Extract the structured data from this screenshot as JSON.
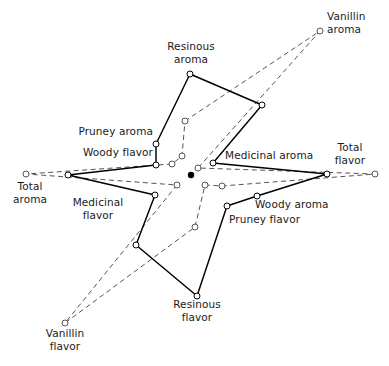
{
  "chart_data": {
    "type": "line",
    "chart_subtype": "radar",
    "title": "",
    "subtitle": "",
    "xlabel": "",
    "ylabel": "",
    "grid": false,
    "legend_position": "none",
    "axis_count": 12,
    "center": {
      "x": 191,
      "y": 175
    },
    "radial_range": [
      0,
      10
    ],
    "categories": [
      "Resinous aroma",
      "Vanillin aroma",
      "Medicinal aroma",
      "Total flavor",
      "Woody aroma",
      "Pruney flavor",
      "Resinous flavor",
      "Vanillin flavor",
      "Medicinal flavor",
      "Total aroma",
      "Woody flavor",
      "Pruney aroma"
    ],
    "series": [
      {
        "name": "Sample A (solid)",
        "style": "solid",
        "color": "#000000",
        "marker": "open-circle",
        "values": [
          9.2,
          4.8,
          2.3,
          9.6,
          3.6,
          3.2,
          10.0,
          5.4,
          3.2,
          9.6,
          2.6,
          3.6
        ],
        "points": [
          {
            "axis": "Resinous aroma",
            "x": 190,
            "y": 74
          },
          {
            "axis": "Vanillin aroma",
            "x": 262,
            "y": 105
          },
          {
            "axis": "Medicinal aroma",
            "x": 213,
            "y": 163
          },
          {
            "axis": "Total flavor",
            "x": 327,
            "y": 174
          },
          {
            "axis": "Woody aroma",
            "x": 257,
            "y": 196
          },
          {
            "axis": "Pruney flavor",
            "x": 227,
            "y": 206
          },
          {
            "axis": "Resinous flavor",
            "x": 197,
            "y": 296
          },
          {
            "axis": "Vanillin flavor",
            "x": 136,
            "y": 245
          },
          {
            "axis": "Medicinal flavor",
            "x": 155,
            "y": 195
          },
          {
            "axis": "Total aroma",
            "x": 68,
            "y": 175
          },
          {
            "axis": "Woody flavor",
            "x": 156,
            "y": 165
          },
          {
            "axis": "Pruney aroma",
            "x": 156,
            "y": 144
          }
        ]
      },
      {
        "name": "Sample B (dashed)",
        "style": "dashed",
        "color": "#555555",
        "marker": "open-circle",
        "values": [
          4.6,
          10.0,
          1.6,
          10.0,
          2.6,
          2.0,
          5.0,
          10.0,
          1.8,
          10.0,
          1.8,
          2.1
        ],
        "points": [
          {
            "axis": "Resinous aroma",
            "x": 185,
            "y": 121
          },
          {
            "axis": "Vanillin aroma",
            "x": 320,
            "y": 31
          },
          {
            "axis": "Medicinal aroma",
            "x": 198,
            "y": 168
          },
          {
            "axis": "Total flavor",
            "x": 375,
            "y": 174
          },
          {
            "axis": "Woody aroma",
            "x": 222,
            "y": 186
          },
          {
            "axis": "Pruney flavor",
            "x": 205,
            "y": 185
          },
          {
            "axis": "Resinous flavor",
            "x": 195,
            "y": 227
          },
          {
            "axis": "Vanillin flavor",
            "x": 65,
            "y": 323
          },
          {
            "axis": "Medicinal flavor",
            "x": 177,
            "y": 185
          },
          {
            "axis": "Total aroma",
            "x": 26,
            "y": 174
          },
          {
            "axis": "Woody flavor",
            "x": 172,
            "y": 164
          },
          {
            "axis": "Pruney aroma",
            "x": 182,
            "y": 156
          }
        ]
      }
    ],
    "center_marker": "filled-dot",
    "annotations": []
  },
  "labels": {
    "resinous_aroma_l1": "Resinous",
    "resinous_aroma_l2": "aroma",
    "vanillin_aroma_l1": "Vanillin",
    "vanillin_aroma_l2": "aroma",
    "pruney_aroma": "Pruney aroma",
    "woody_flavor": "Woody flavor",
    "medicinal_aroma": "Medicinal aroma",
    "total_flavor_l1": "Total",
    "total_flavor_l2": "flavor",
    "total_aroma_l1": "Total",
    "total_aroma_l2": "aroma",
    "medicinal_flavor_l1": "Medicinal",
    "medicinal_flavor_l2": "flavor",
    "woody_aroma": "Woody aroma",
    "pruney_flavor": "Pruney flavor",
    "resinous_flavor_l1": "Resinous",
    "resinous_flavor_l2": "flavor",
    "vanillin_flavor_l1": "Vanillin",
    "vanillin_flavor_l2": "flavor"
  },
  "colors": {
    "series_solid": "#000000",
    "series_dashed": "#555555",
    "marker_fill": "#ffffff",
    "text": "#1a1a1a",
    "background": "#ffffff"
  }
}
